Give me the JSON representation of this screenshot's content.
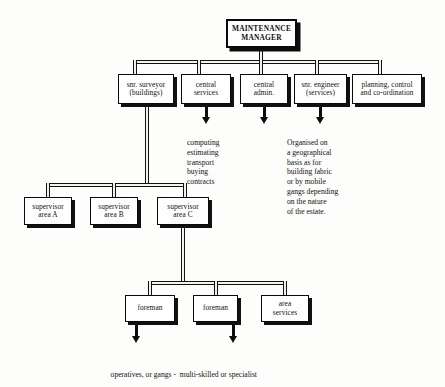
{
  "diagram": {
    "root": {
      "label": "MAINTENANCE\nMANAGER"
    },
    "level2": [
      {
        "label": "snr. surveyor\n(buildings)"
      },
      {
        "label": "central\nservices"
      },
      {
        "label": "central\nadmin."
      },
      {
        "label": "snr. engineer\n(services)"
      },
      {
        "label": "planning, control\nand co-ordination"
      }
    ],
    "annotations": [
      {
        "name": "central-services-detail",
        "text": "computing\nestimating\ntransport\nbuying\ncontracts"
      },
      {
        "name": "snr-engineer-detail",
        "text": "Organised on\na geographical\nbasis as for\nbuilding fabric\nor by mobile\ngangs depending\non the nature\nof the estate."
      }
    ],
    "level3": [
      {
        "label": "supervisor\narea A"
      },
      {
        "label": "supervisor\narea B"
      },
      {
        "label": "supervisor\narea C"
      }
    ],
    "level4": [
      {
        "label": "foreman"
      },
      {
        "label": "foreman"
      },
      {
        "label": "area\nservices"
      }
    ],
    "caption": {
      "text": "operatives, or gangs -  multi-skilled or specialist"
    },
    "colors": {
      "line": "#121212",
      "box_border": "#0a0a0a",
      "box_fill": "#ffffff",
      "shadow": "#111111",
      "text": "#111111",
      "background": "#fdfdfb"
    }
  }
}
